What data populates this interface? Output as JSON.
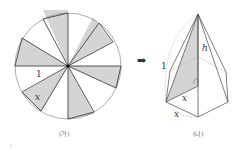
{
  "figure_a": {
    "caption": "(가)",
    "radius_label": "1",
    "side_label": "x",
    "sectors": 10,
    "shaded_fill": "#d4d4d4"
  },
  "arrow": "➡",
  "figure_b": {
    "caption": "(나)",
    "edge_label": "1",
    "height_label": "h",
    "inner_label": "x",
    "base_label": "x",
    "shaded_fill": "#d4d4d4"
  },
  "footnote": "1"
}
